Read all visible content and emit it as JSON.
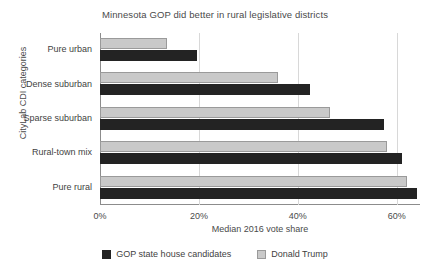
{
  "chart_data": {
    "type": "bar",
    "orientation": "horizontal",
    "title": "Minnesota GOP did better in rural legislative districts",
    "xlabel": "Median 2016 vote share",
    "ylabel": "CityLab CDI categories",
    "categories": [
      "Pure urban",
      "Dense suburban",
      "Sparse suburban",
      "Rural-town mix",
      "Pure rural"
    ],
    "series": [
      {
        "name": "GOP state house candidates",
        "color": "#232323",
        "values": [
          19.7,
          42.5,
          57.5,
          61.0,
          64.0
        ]
      },
      {
        "name": "Donald Trump",
        "color": "#c9c9c9",
        "values": [
          13.5,
          36.0,
          46.5,
          58.0,
          62.0
        ]
      }
    ],
    "xlim": [
      0,
      64.7
    ],
    "xticks": [
      0,
      20,
      40,
      60
    ],
    "xtick_labels": [
      "0%",
      "20%",
      "40%",
      "60%"
    ],
    "grid": "vertical",
    "legend_position": "bottom"
  }
}
